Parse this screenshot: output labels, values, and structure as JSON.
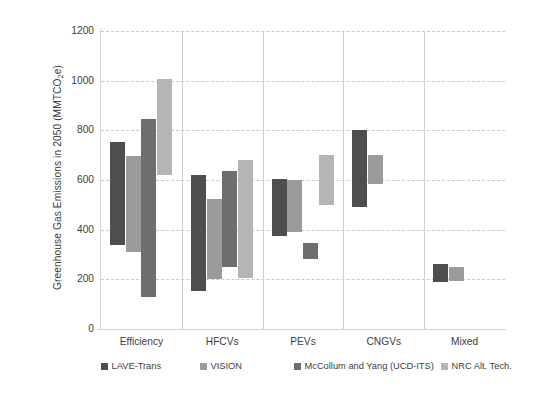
{
  "chart_data": {
    "type": "bar",
    "subtype": "floating-range-bar",
    "title": "",
    "xlabel": "",
    "ylabel": "Greenhouse Gas Emissions  in 2050 (MMTCO₂e)",
    "ylabel_parts": {
      "pre": "Greenhouse Gas Emissions  in 2050 (MMTCO",
      "sub": "2",
      "post": "e)"
    },
    "ylim": [
      0,
      1200
    ],
    "yticks": [
      0,
      200,
      400,
      600,
      800,
      1000,
      1200
    ],
    "ytick_labels": [
      "0",
      "200",
      "400",
      "600",
      "800",
      "1000",
      "1200"
    ],
    "grid": true,
    "grid_style": "dashed-horizontal",
    "legend_position": "bottom",
    "categories": [
      "Efficiency",
      "HFCVs",
      "PEVs",
      "CNGVs",
      "Mixed"
    ],
    "series": [
      {
        "name": "LAVE-Trans",
        "color": "#4e4e4e",
        "ranges": [
          {
            "category": "Efficiency",
            "low": 340,
            "high": 755
          },
          {
            "category": "HFCVs",
            "low": 155,
            "high": 620
          },
          {
            "category": "PEVs",
            "low": 375,
            "high": 605
          },
          {
            "category": "CNGVs",
            "low": 490,
            "high": 800
          },
          {
            "category": "Mixed",
            "low": 190,
            "high": 260
          }
        ]
      },
      {
        "name": "VISION",
        "color": "#9b9b9b",
        "ranges": [
          {
            "category": "Efficiency",
            "low": 310,
            "high": 695
          },
          {
            "category": "HFCVs",
            "low": 200,
            "high": 525
          },
          {
            "category": "PEVs",
            "low": 390,
            "high": 598
          },
          {
            "category": "CNGVs",
            "low": 585,
            "high": 700
          },
          {
            "category": "Mixed",
            "low": 195,
            "high": 250
          }
        ]
      },
      {
        "name": "McCollum and Yang (UCD-ITS)",
        "color": "#6e6e6e",
        "ranges": [
          {
            "category": "Efficiency",
            "low": 130,
            "high": 845
          },
          {
            "category": "HFCVs",
            "low": 250,
            "high": 638
          },
          {
            "category": "PEVs",
            "low": 280,
            "high": 348
          },
          {
            "category": "CNGVs",
            "low": null,
            "high": null
          },
          {
            "category": "Mixed",
            "low": null,
            "high": null
          }
        ]
      },
      {
        "name": "NRC Alt. Tech.",
        "color": "#b5b5b5",
        "ranges": [
          {
            "category": "Efficiency",
            "low": 620,
            "high": 1008
          },
          {
            "category": "HFCVs",
            "low": 205,
            "high": 682
          },
          {
            "category": "PEVs",
            "low": 500,
            "high": 700
          },
          {
            "category": "CNGVs",
            "low": null,
            "high": null
          },
          {
            "category": "Mixed",
            "low": null,
            "high": null
          }
        ]
      }
    ]
  },
  "axis": {
    "y_title": "Greenhouse Gas Emissions  in 2050 (MMTCO",
    "y_title_sub": "2",
    "y_title_post": "e)",
    "ticks": [
      {
        "label": "1200"
      },
      {
        "label": "1000"
      },
      {
        "label": "800"
      },
      {
        "label": "600"
      },
      {
        "label": "400"
      },
      {
        "label": "200"
      },
      {
        "label": "0"
      }
    ]
  },
  "groups": [
    {
      "label": "Efficiency"
    },
    {
      "label": "HFCVs"
    },
    {
      "label": "PEVs"
    },
    {
      "label": "CNGVs"
    },
    {
      "label": "Mixed"
    }
  ],
  "legend": {
    "items": [
      {
        "label": "LAVE-Trans",
        "color": "#4e4e4e"
      },
      {
        "label": "VISION",
        "color": "#9b9b9b"
      },
      {
        "label": "McCollum and Yang (UCD-ITS)",
        "color": "#6e6e6e"
      },
      {
        "label": "NRC Alt. Tech.",
        "color": "#b5b5b5"
      }
    ]
  }
}
